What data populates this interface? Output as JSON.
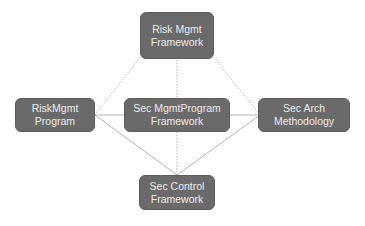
{
  "diagram": {
    "type": "network",
    "colors": {
      "node_fill": "#6a6a6a",
      "node_text": "#ececec",
      "line": "#a9a9a9"
    },
    "nodes": {
      "top": {
        "line1": "Risk Mgmt",
        "line2": "Framework"
      },
      "left": {
        "line1": "RiskMgmt",
        "line2": "Program"
      },
      "center": {
        "line1": "Sec MgmtProgram",
        "line2": "Framework"
      },
      "right": {
        "line1": "Sec Arch",
        "line2": "Methodology"
      },
      "bottom": {
        "line1": "Sec Control",
        "line2": "Framework"
      }
    },
    "edges": [
      {
        "from": "top",
        "to": "left",
        "style": "dotted"
      },
      {
        "from": "top",
        "to": "right",
        "style": "dotted"
      },
      {
        "from": "top",
        "to": "bottom",
        "style": "dotted",
        "via": "center"
      },
      {
        "from": "left",
        "to": "right",
        "style": "solid",
        "via": "center"
      },
      {
        "from": "bottom",
        "to": "left",
        "style": "solid"
      },
      {
        "from": "bottom",
        "to": "right",
        "style": "solid"
      }
    ]
  }
}
